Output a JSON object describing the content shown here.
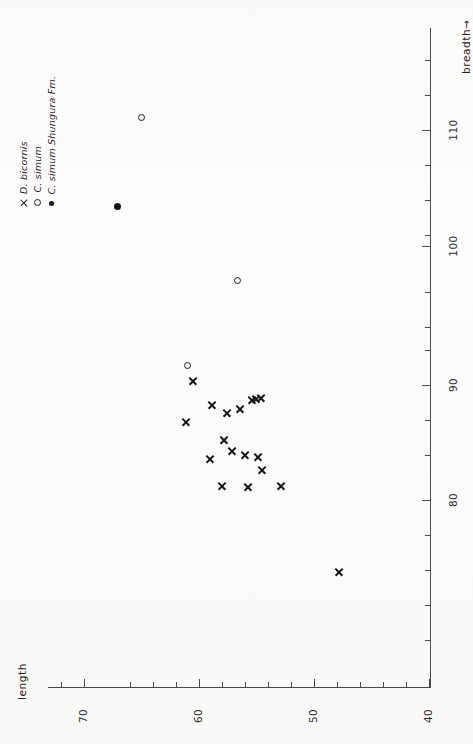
{
  "figure": {
    "axis_x_title": "length",
    "axis_y_title": "breadth→",
    "axis_y_title_plain": "breadth",
    "arrow_glyph": "→"
  },
  "legend": {
    "items": [
      {
        "marker": "cross-marker",
        "label": "D. bicornis",
        "genus": "D. bicornis"
      },
      {
        "marker": "open-circle-marker",
        "label": "C. simum",
        "genus": "C. simum"
      },
      {
        "marker": "filled-circle-marker",
        "label": "C. simum  Shungura Fm.",
        "genus": "C. simum",
        "suffix": "Shungura Fm."
      }
    ]
  },
  "chart_data": {
    "type": "scatter",
    "title": "",
    "xlabel": "breadth",
    "ylabel": "length",
    "orientation": "rotated-90",
    "grid": false,
    "legend_position": "top-left",
    "xlim": [
      40,
      115
    ],
    "ylim": [
      40,
      72
    ],
    "x_ticks_major": [
      80,
      90,
      100,
      110
    ],
    "y_ticks_major": [
      40,
      50,
      60,
      70
    ],
    "x_tick_labels": [
      "80",
      "90",
      "100",
      "110"
    ],
    "y_tick_labels": [
      "40",
      "50",
      "60",
      "70"
    ],
    "minor_tick_step": 2,
    "series": [
      {
        "name": "D. bicornis",
        "marker": "x",
        "points": [
          {
            "breadth": 89.7,
            "length": 60.3,
            "px": 193,
            "py": 381
          },
          {
            "breadth": 88.9,
            "length": 58.1,
            "px": 212,
            "py": 405
          },
          {
            "breadth": 89.2,
            "length": 56.5,
            "px": 227,
            "py": 413
          },
          {
            "breadth": 85.8,
            "length": 59.2,
            "px": 186,
            "py": 422
          },
          {
            "breadth": 90.3,
            "length": 56.8,
            "px": 240,
            "py": 409
          },
          {
            "breadth": 91.0,
            "length": 56.0,
            "px": 252,
            "py": 400
          },
          {
            "breadth": 91.4,
            "length": 55.6,
            "px": 261,
            "py": 398
          },
          {
            "breadth": 90.8,
            "length": 55.8,
            "px": 256,
            "py": 399
          },
          {
            "breadth": 86.4,
            "length": 57.6,
            "px": 224,
            "py": 440
          },
          {
            "breadth": 84.9,
            "length": 58.6,
            "px": 210,
            "py": 459
          },
          {
            "breadth": 85.2,
            "length": 56.9,
            "px": 232,
            "py": 451
          },
          {
            "breadth": 85.6,
            "length": 56.2,
            "px": 245,
            "py": 455
          },
          {
            "breadth": 83.0,
            "length": 55.1,
            "px": 258,
            "py": 457
          },
          {
            "breadth": 82.8,
            "length": 54.6,
            "px": 262,
            "py": 470
          },
          {
            "breadth": 82.4,
            "length": 58.4,
            "px": 222,
            "py": 486
          },
          {
            "breadth": 82.2,
            "length": 56.8,
            "px": 248,
            "py": 487
          },
          {
            "breadth": 82.0,
            "length": 54.9,
            "px": 281,
            "py": 486
          },
          {
            "breadth": 74.6,
            "length": 50.9,
            "px": 339,
            "py": 572
          }
        ]
      },
      {
        "name": "C. simum",
        "marker": "o",
        "points": [
          {
            "breadth": 112.2,
            "length": 63.7,
            "px": 141,
            "py": 117
          },
          {
            "breadth": 99.2,
            "length": 55.4,
            "px": 237,
            "py": 280
          },
          {
            "breadth": 90.6,
            "length": 61.2,
            "px": 187,
            "py": 365
          }
        ]
      },
      {
        "name": "C. simum Shungura Fm.",
        "marker": "filled-circle",
        "points": [
          {
            "breadth": 104.8,
            "length": 65.6,
            "px": 117,
            "py": 206
          }
        ]
      }
    ]
  }
}
